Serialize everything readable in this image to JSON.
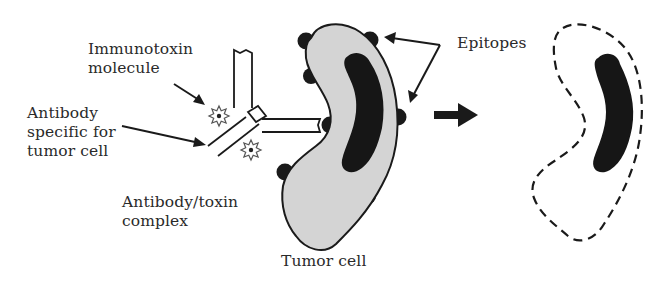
{
  "diagram": {
    "labels": {
      "immunotoxin": [
        "Immunotoxin",
        "molecule"
      ],
      "antibody": [
        "Antibody",
        "specific for",
        "tumor cell"
      ],
      "complex": [
        "Antibody/toxin",
        "complex"
      ],
      "tumor_cell": "Tumor cell",
      "epitopes": "Epitopes"
    },
    "nodes": [
      {
        "id": "immunotoxin-molecule",
        "shape": "star",
        "label": "Immunotoxin molecule"
      },
      {
        "id": "antibody",
        "shape": "Y-shaped antibody",
        "label": "Antibody specific for tumor cell"
      },
      {
        "id": "complex",
        "shape": "antibody with attached toxins",
        "label": "Antibody/toxin complex"
      },
      {
        "id": "tumor-cell",
        "shape": "curved cell with nucleus and surface epitopes",
        "label": "Tumor cell"
      },
      {
        "id": "dead-cell",
        "shape": "dashed outline with nucleus",
        "label": ""
      }
    ],
    "edges": [
      {
        "from": "immunotoxin-label",
        "to": "toxin-star",
        "type": "pointer-arrow"
      },
      {
        "from": "antibody-label",
        "to": "antibody-arm",
        "type": "pointer-arrow"
      },
      {
        "from": "epitopes-label",
        "to": "epitope-top",
        "type": "pointer-arrow"
      },
      {
        "from": "epitopes-label",
        "to": "epitope-right",
        "type": "pointer-arrow"
      },
      {
        "from": "tumor-cell",
        "to": "dead-cell",
        "type": "process-arrow"
      }
    ],
    "colors": {
      "ink": "#1a1a1a",
      "cell_fill": "#d4d4d4",
      "text": "#2a2a2a"
    }
  }
}
